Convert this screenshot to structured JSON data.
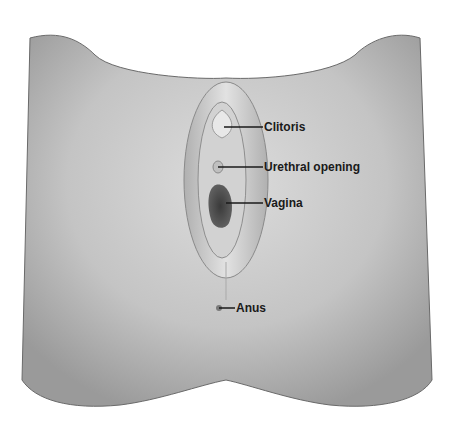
{
  "diagram": {
    "type": "anatomical-illustration",
    "palette": {
      "background": "#ffffff",
      "skin": "#c9c9c9",
      "shadow": "#8e8e8e",
      "text": "#1a1a1a"
    },
    "callouts": [
      {
        "id": "clitoris",
        "label": "Clitoris",
        "line": [
          224,
          127,
          263,
          127
        ],
        "text_xy": [
          264,
          120
        ]
      },
      {
        "id": "urethral-opening",
        "label": "Urethral opening",
        "line": [
          218,
          167,
          263,
          167
        ],
        "text_xy": [
          264,
          160
        ]
      },
      {
        "id": "vagina",
        "label": "Vagina",
        "line": [
          226,
          203,
          263,
          203
        ],
        "text_xy": [
          264,
          196
        ]
      },
      {
        "id": "anus",
        "label": "Anus",
        "line": [
          219,
          308,
          235,
          308
        ],
        "text_xy": [
          236,
          301
        ]
      }
    ]
  }
}
